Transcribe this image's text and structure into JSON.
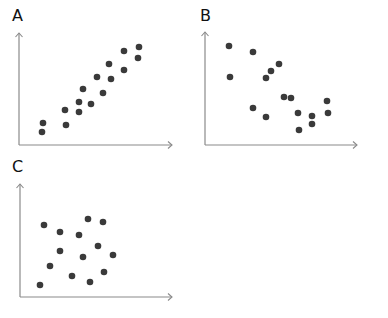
{
  "chart_data": [
    {
      "type": "scatter",
      "title": "A",
      "xlabel": "",
      "ylabel": "",
      "description": "strong positive correlation",
      "axes": {
        "origin": [
          19,
          145
        ],
        "x_end": 172,
        "y_end": 33
      },
      "points": [
        [
          43,
          123
        ],
        [
          42,
          132
        ],
        [
          65,
          110
        ],
        [
          66,
          125
        ],
        [
          79,
          102
        ],
        [
          79,
          112
        ],
        [
          91,
          104
        ],
        [
          83,
          89
        ],
        [
          103,
          93
        ],
        [
          97,
          77
        ],
        [
          111,
          79
        ],
        [
          109,
          64
        ],
        [
          124,
          70
        ],
        [
          124,
          51
        ],
        [
          138,
          58
        ],
        [
          139,
          47
        ]
      ]
    },
    {
      "type": "scatter",
      "title": "B",
      "xlabel": "",
      "ylabel": "",
      "description": "moderate negative correlation",
      "axes": {
        "origin": [
          205,
          145
        ],
        "x_end": 357,
        "y_end": 32
      },
      "points": [
        [
          229,
          46
        ],
        [
          230,
          77
        ],
        [
          253,
          52
        ],
        [
          266,
          78
        ],
        [
          271,
          71
        ],
        [
          279,
          64
        ],
        [
          253,
          108
        ],
        [
          266,
          117
        ],
        [
          284,
          97
        ],
        [
          291,
          98
        ],
        [
          298,
          113
        ],
        [
          299,
          130
        ],
        [
          312,
          116
        ],
        [
          312,
          124
        ],
        [
          327,
          101
        ],
        [
          328,
          113
        ]
      ]
    },
    {
      "type": "scatter",
      "title": "C",
      "xlabel": "",
      "ylabel": "",
      "description": "no correlation",
      "axes": {
        "origin": [
          20,
          297
        ],
        "x_end": 172,
        "y_end": 184
      },
      "points": [
        [
          44,
          225
        ],
        [
          60,
          232
        ],
        [
          88,
          219
        ],
        [
          103,
          222
        ],
        [
          79,
          235
        ],
        [
          60,
          251
        ],
        [
          98,
          246
        ],
        [
          83,
          257
        ],
        [
          113,
          255
        ],
        [
          50,
          266
        ],
        [
          72,
          276
        ],
        [
          104,
          272
        ],
        [
          40,
          285
        ],
        [
          90,
          282
        ]
      ]
    }
  ],
  "labels": {
    "a": "A",
    "b": "B",
    "c": "C"
  },
  "colors": {
    "dot": "#3a3a3a",
    "axis": "#8a8a8a"
  }
}
